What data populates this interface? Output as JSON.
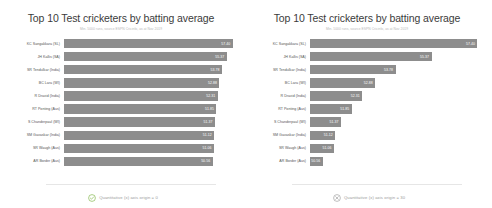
{
  "figure": {
    "background_color": "#ffffff",
    "bar_color": "#8d8d8d",
    "value_text_color": "#ffffff",
    "panel_count": 2
  },
  "left_panel": {
    "title": "Top 10 Test cricketers by batting average",
    "subtitle": "Min. 5000 runs, source ESPN Cricinfo, as at Nov 2019",
    "footer_label": "Quantitative (x) axis origin = 0",
    "footer_icon": "check-circle-icon",
    "footer_icon_color": "#7cb342"
  },
  "right_panel": {
    "title": "Top 10 Test cricketers by batting average",
    "subtitle": "Min. 5000 runs, source ESPN Cricinfo, as at Nov 2019",
    "footer_label": "Quantitative (x) axis origin = 30",
    "footer_icon": "cross-circle-icon",
    "footer_icon_color": "#9a9a9a"
  },
  "chart_data": [
    {
      "type": "bar",
      "orientation": "horizontal",
      "title": "Top 10 Test cricketers by batting average",
      "subtitle": "Min. 5000 runs, source ESPN Cricinfo, as at Nov 2019",
      "xlabel": "",
      "ylabel": "",
      "xlim": [
        0,
        58.5
      ],
      "x_origin": 0,
      "grid": false,
      "legend": false,
      "categories": [
        "KC Sangakkara (SL)",
        "JH Kallis (SA)",
        "SR Tendulkar (India)",
        "BC Lara (WI)",
        "R Dravid (India)",
        "RT Ponting (Aus)",
        "S Chanderpaul (WI)",
        "SM Gavaskar (India)",
        "SR Waugh (Aus)",
        "AR Border (Aus)"
      ],
      "values": [
        57.4,
        55.37,
        53.78,
        52.88,
        52.31,
        51.85,
        51.37,
        51.12,
        51.06,
        50.56
      ],
      "value_labels": [
        "57.40",
        "55.37",
        "53.78",
        "52.88",
        "52.31",
        "51.85",
        "51.37",
        "51.12",
        "51.06",
        "50.56"
      ]
    },
    {
      "type": "bar",
      "orientation": "horizontal",
      "title": "Top 10 Test cricketers by batting average",
      "subtitle": "Min. 5000 runs, source ESPN Cricinfo, as at Nov 2019",
      "xlabel": "",
      "ylabel": "",
      "xlim": [
        50,
        57.6
      ],
      "x_origin": 50,
      "grid": false,
      "legend": false,
      "categories": [
        "KC Sangakkara (SL)",
        "JH Kallis (SA)",
        "SR Tendulkar (India)",
        "BC Lara (WI)",
        "R Dravid (India)",
        "RT Ponting (Aus)",
        "S Chanderpaul (WI)",
        "SM Gavaskar (India)",
        "SR Waugh (Aus)",
        "AR Border (Aus)"
      ],
      "values": [
        57.4,
        55.37,
        53.78,
        52.88,
        52.31,
        51.85,
        51.37,
        51.12,
        51.06,
        50.56
      ],
      "value_labels": [
        "57.40",
        "55.37",
        "53.78",
        "52.88",
        "52.31",
        "51.85",
        "51.37",
        "51.12",
        "51.06",
        "50.56"
      ]
    }
  ]
}
